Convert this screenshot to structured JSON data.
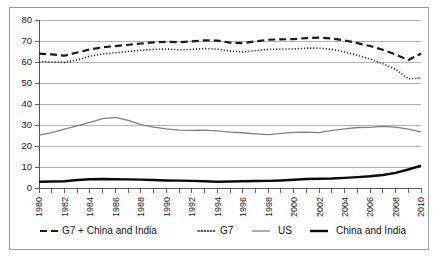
{
  "chart_data": {
    "type": "line",
    "title": "",
    "subtitle": "",
    "xlabel": "",
    "ylabel": "",
    "xlim": [
      1980,
      2010
    ],
    "ylim": [
      0,
      80
    ],
    "ytick_step": 10,
    "xtick_step": 2,
    "grid": true,
    "legend_position": "bottom",
    "yticks": [
      "0",
      "10",
      "20",
      "30",
      "40",
      "50",
      "60",
      "70",
      "80"
    ],
    "xticks": [
      "1980",
      "1982",
      "1984",
      "1986",
      "1988",
      "1990",
      "1992",
      "1994",
      "1996",
      "1998",
      "2000",
      "2002",
      "2004",
      "2006",
      "2008",
      "2010"
    ],
    "x": [
      1980,
      1981,
      1982,
      1983,
      1984,
      1985,
      1986,
      1987,
      1988,
      1989,
      1990,
      1991,
      1992,
      1993,
      1994,
      1995,
      1996,
      1997,
      1998,
      1999,
      2000,
      2001,
      2002,
      2003,
      2004,
      2005,
      2006,
      2007,
      2008,
      2009,
      2010
    ],
    "series": [
      {
        "name": "G7 + China and India",
        "style": "dashed",
        "color": "#1a1a1a",
        "width": 2.2,
        "values": [
          64.0,
          63.6,
          63.0,
          64.5,
          66.0,
          67.0,
          67.6,
          68.2,
          68.8,
          69.3,
          69.6,
          69.4,
          69.8,
          70.3,
          70.2,
          69.2,
          69.0,
          69.8,
          70.6,
          70.8,
          70.9,
          71.4,
          71.6,
          71.2,
          70.3,
          69.0,
          67.6,
          65.8,
          63.6,
          61.0,
          64.0
        ]
      },
      {
        "name": "G7",
        "style": "dotted",
        "color": "#2a2a2a",
        "width": 1.6,
        "values": [
          60.2,
          60.0,
          59.8,
          61.0,
          62.8,
          63.8,
          64.4,
          65.0,
          65.6,
          66.0,
          66.2,
          65.8,
          66.0,
          66.4,
          66.2,
          65.2,
          64.8,
          65.4,
          66.0,
          66.2,
          66.2,
          66.6,
          66.6,
          66.0,
          64.8,
          63.2,
          61.4,
          59.2,
          56.6,
          52.0,
          52.4
        ]
      },
      {
        "name": "US",
        "style": "solid-thin",
        "color": "#808080",
        "width": 1.3,
        "values": [
          25.2,
          26.4,
          28.0,
          29.6,
          31.2,
          33.0,
          33.6,
          32.2,
          30.2,
          29.0,
          28.2,
          27.6,
          27.4,
          27.6,
          27.2,
          26.6,
          26.3,
          25.8,
          25.4,
          26.0,
          26.5,
          26.6,
          26.4,
          27.4,
          28.2,
          28.8,
          28.9,
          29.3,
          29.0,
          28.0,
          26.7
        ]
      },
      {
        "name": "China and India",
        "style": "solid-thick",
        "color": "#0a0a0a",
        "width": 2.4,
        "values": [
          3.0,
          3.1,
          3.2,
          3.8,
          4.2,
          4.3,
          4.2,
          4.1,
          4.0,
          3.8,
          3.6,
          3.5,
          3.4,
          3.2,
          3.0,
          3.1,
          3.2,
          3.3,
          3.4,
          3.6,
          3.9,
          4.3,
          4.4,
          4.5,
          4.8,
          5.2,
          5.6,
          6.2,
          7.2,
          8.8,
          10.6
        ]
      }
    ]
  },
  "legend": {
    "items": [
      {
        "label": "G7 + China and India",
        "style": "dashed"
      },
      {
        "label": "G7",
        "style": "dotted"
      },
      {
        "label": "US",
        "style": "solid-thin"
      },
      {
        "label": "China and India",
        "style": "solid-thick"
      }
    ]
  },
  "colors": {
    "frame_border": "#9a9a9a",
    "gridline": "#9d9d9d",
    "axis": "#555555",
    "background": "#ffffff"
  }
}
